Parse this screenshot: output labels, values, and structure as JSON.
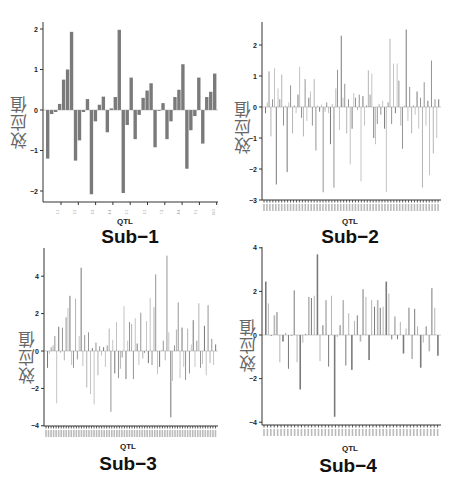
{
  "chart_data": [
    {
      "type": "bar",
      "title": "Sub−1",
      "xlabel": "QTL",
      "ylabel": "效应值",
      "ylim": [
        -2.2,
        2.2
      ],
      "yticks": [
        -2,
        -1,
        0,
        1,
        2
      ],
      "grid": false,
      "groups": 10,
      "values": [
        -1.2,
        -0.1,
        -0.05,
        0.15,
        0.75,
        1.0,
        1.93,
        -1.25,
        -0.75,
        -0.05,
        0.27,
        -2.08,
        -0.28,
        0.13,
        0.33,
        -0.55,
        0.04,
        0.32,
        1.98,
        -2.05,
        -0.37,
        0.8,
        -0.72,
        -0.12,
        0.3,
        0.48,
        0.66,
        -0.92,
        -0.02,
        0.17,
        -0.72,
        -0.28,
        0.32,
        0.5,
        1.13,
        -1.45,
        -0.5,
        -0.15,
        0.8,
        -0.83,
        0.32,
        0.45,
        0.9
      ]
    },
    {
      "type": "bar",
      "title": "Sub−2",
      "xlabel": "QTL",
      "ylabel": "效应值",
      "ylim": [
        -3,
        2.7
      ],
      "yticks": [
        -3,
        -2,
        -1,
        0,
        1,
        2
      ],
      "grid": false,
      "values": [
        -0.2,
        0.15,
        1.15,
        -0.95,
        0.25,
        1.25,
        -2.5,
        0.6,
        0.25,
        1.05,
        -0.6,
        0.05,
        -2.1,
        0.15,
        0.7,
        -0.85,
        0.05,
        -0.2,
        0.4,
        1.3,
        -0.35,
        -0.95,
        0.9,
        -0.45,
        0.3,
        0.5,
        -0.6,
        0.9,
        -1.4,
        0.05,
        -0.15,
        0.08,
        -2.75,
        -0.15,
        0.15,
        -0.2,
        -1.2,
        0.1,
        -2.6,
        0.6,
        1.2,
        -0.75,
        2.3,
        0.3,
        0.75,
        -0.85,
        0.25,
        -1.85,
        -0.7,
        0.45,
        0.3,
        -0.1,
        0.4,
        -2.4,
        0.35,
        -0.6,
        0.05,
        1.18,
        0.4,
        1.08,
        -1.0,
        -1.2,
        -0.55,
        0.1,
        -0.25,
        0.2,
        -0.7,
        -2.75,
        0.15,
        2.2,
        -0.55,
        1.4,
        -0.2,
        1.4,
        0.85,
        -0.6,
        -1.35,
        0.05,
        2.5,
        -0.45,
        0.65,
        -0.85,
        0.05,
        -0.25,
        0.5,
        -0.7,
        0.3,
        -2.6,
        0.8,
        -0.6,
        0.2,
        -2.2,
        1.5,
        -1.5,
        0.25,
        -1.0,
        0.25
      ]
    },
    {
      "type": "bar",
      "title": "Sub−3",
      "xlabel": "QTL",
      "ylabel": "效应值",
      "ylim": [
        -4,
        5.2
      ],
      "yticks": [
        -4,
        -2,
        0,
        2,
        4
      ],
      "grid": false,
      "values": [
        -0.9,
        -0.15,
        0.2,
        0.3,
        0.8,
        -2.8,
        1.3,
        -0.1,
        1.25,
        -0.5,
        1.8,
        2.3,
        2.95,
        -0.75,
        -0.9,
        2.8,
        -0.45,
        0.8,
        4.45,
        -0.8,
        0.85,
        -1.95,
        1.0,
        -2.3,
        0.15,
        -2.85,
        0.45,
        -1.3,
        0.25,
        -0.25,
        0.2,
        -0.85,
        0.3,
        1.2,
        -3.25,
        0.6,
        -1.2,
        1.55,
        -1.45,
        -0.95,
        -0.35,
        2.4,
        -1.5,
        0.55,
        1.55,
        1.45,
        -1.5,
        1.75,
        0.4,
        -0.75,
        2.05,
        -0.4,
        -0.1,
        1.6,
        -0.65,
        2.85,
        -0.75,
        2.35,
        4.1,
        -1.25,
        -0.85,
        0.05,
        0.55,
        -0.5,
        5.1,
        1.0,
        -3.55,
        -1.6,
        0.3,
        1.15,
        2.6,
        -1.45,
        1.25,
        -0.85,
        -1.55,
        1.2,
        -1.2,
        0.35,
        1.65,
        -0.85,
        0.55,
        2.55,
        -0.9,
        -0.7,
        1.35,
        -1.3,
        2.45,
        -0.65,
        0.65,
        -0.75,
        0.35
      ]
    },
    {
      "type": "bar",
      "title": "Sub−4",
      "xlabel": "QTL",
      "ylabel": "效应值",
      "ylim": [
        -4,
        4
      ],
      "yticks": [
        -4,
        -2,
        0,
        2,
        4
      ],
      "grid": false,
      "values": [
        2.45,
        1.45,
        -0.05,
        0.9,
        1.05,
        -1.25,
        -0.3,
        0.1,
        -1.55,
        -0.05,
        2.05,
        -1.25,
        -2.5,
        -0.35,
        0.05,
        1.75,
        1.7,
        1.8,
        3.7,
        -1.2,
        0.45,
        1.6,
        -1.45,
        1.8,
        -3.75,
        -0.1,
        0.45,
        1.6,
        -1.4,
        1.0,
        -1.6,
        0.65,
        0.9,
        -0.3,
        2.1,
        1.75,
        -1.15,
        1.6,
        1.3,
        1.6,
        1.25,
        1.3,
        2.45,
        1.9,
        -0.2,
        0.85,
        -0.2,
        0.6,
        -0.85,
        0.3,
        1.25,
        -1.1,
        1.2,
        0.4,
        -1.5,
        -0.35,
        0.4,
        -0.75,
        2.15,
        1.25,
        -0.95
      ]
    }
  ],
  "panels": [
    {
      "title": "Sub−1",
      "xlabel": "QTL",
      "ylabel": "效应值"
    },
    {
      "title": "Sub−2",
      "xlabel": "QTL",
      "ylabel": "效应值"
    },
    {
      "title": "Sub−3",
      "xlabel": "QTL",
      "ylabel": "效应值"
    },
    {
      "title": "Sub−4",
      "xlabel": "QTL",
      "ylabel": "效应值"
    }
  ],
  "colors": {
    "bar_dark": "#7a7a7a",
    "bar_light": "#b5b5b5",
    "axis": "#333333"
  }
}
